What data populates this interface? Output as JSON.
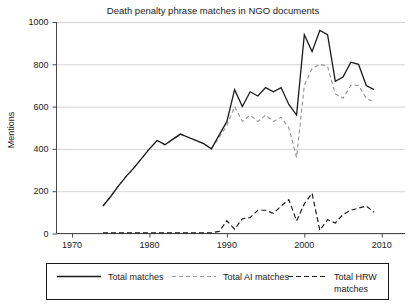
{
  "chart_data": {
    "type": "line",
    "title": "Death penalty phrase matches in NGO documents",
    "xlabel": "",
    "ylabel": "Mentions",
    "xlim": [
      1968,
      2013
    ],
    "ylim": [
      0,
      1000
    ],
    "yticks": [
      0,
      200,
      400,
      600,
      800,
      1000
    ],
    "xticks": [
      1970,
      1980,
      1990,
      2000,
      2010
    ],
    "grid": true,
    "legend_position": "bottom",
    "series": [
      {
        "name": "Total matches",
        "style": "solid",
        "color": "#1a1a1a",
        "x": [
          1974,
          1975,
          1976,
          1977,
          1978,
          1979,
          1980,
          1981,
          1982,
          1983,
          1984,
          1985,
          1986,
          1987,
          1988,
          1989,
          1990,
          1991,
          1992,
          1993,
          1994,
          1995,
          1996,
          1997,
          1998,
          1999,
          2000,
          2001,
          2002,
          2003,
          2004,
          2005,
          2006,
          2007,
          2008,
          2009
        ],
        "values": [
          130,
          175,
          225,
          270,
          310,
          355,
          400,
          440,
          420,
          445,
          470,
          455,
          440,
          425,
          400,
          465,
          530,
          680,
          600,
          670,
          650,
          690,
          670,
          690,
          610,
          560,
          940,
          860,
          960,
          940,
          720,
          740,
          810,
          800,
          700,
          680
        ]
      },
      {
        "name": "Total AI matches",
        "style": "dashed-gray",
        "color": "#9a9a9a",
        "x": [
          1974,
          1975,
          1976,
          1977,
          1978,
          1979,
          1980,
          1981,
          1982,
          1983,
          1984,
          1985,
          1986,
          1987,
          1988,
          1989,
          1990,
          1991,
          1992,
          1993,
          1994,
          1995,
          1996,
          1997,
          1998,
          1999,
          2000,
          2001,
          2002,
          2003,
          2004,
          2005,
          2006,
          2007,
          2008,
          2009
        ],
        "values": [
          130,
          175,
          225,
          270,
          310,
          355,
          400,
          440,
          420,
          445,
          470,
          455,
          440,
          425,
          400,
          455,
          510,
          600,
          530,
          560,
          530,
          560,
          530,
          550,
          500,
          360,
          700,
          780,
          800,
          790,
          660,
          640,
          700,
          700,
          640,
          620
        ]
      },
      {
        "name": "Total HRW matches",
        "style": "dashed-black",
        "color": "#1a1a1a",
        "x": [
          1974,
          1975,
          1976,
          1977,
          1978,
          1979,
          1980,
          1981,
          1982,
          1983,
          1984,
          1985,
          1986,
          1987,
          1988,
          1989,
          1990,
          1991,
          1992,
          1993,
          1994,
          1995,
          1996,
          1997,
          1998,
          1999,
          2000,
          2001,
          2002,
          2003,
          2004,
          2005,
          2006,
          2007,
          2008,
          2009
        ],
        "values": [
          3,
          3,
          3,
          3,
          3,
          3,
          3,
          3,
          3,
          3,
          3,
          3,
          3,
          3,
          3,
          10,
          60,
          20,
          70,
          75,
          110,
          110,
          95,
          130,
          160,
          60,
          140,
          190,
          15,
          65,
          50,
          90,
          110,
          120,
          130,
          100
        ]
      }
    ]
  },
  "legend": {
    "items": [
      {
        "label": "Total matches",
        "style": "solid",
        "color": "#1a1a1a"
      },
      {
        "label": "Total AI matches",
        "style": "dashed-gray",
        "color": "#9a9a9a"
      },
      {
        "label": "Total HRW",
        "label2": "matches",
        "style": "dashed-black",
        "color": "#1a1a1a"
      }
    ]
  }
}
